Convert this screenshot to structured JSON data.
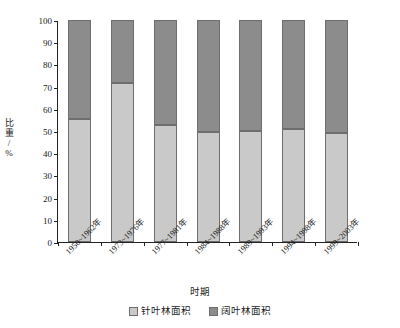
{
  "chart_data": {
    "type": "bar",
    "subtype": "stacked-100-percent",
    "title": "",
    "xlabel": "时期",
    "ylabel": "比重/%",
    "ylim": [
      0,
      100
    ],
    "yticks": [
      0,
      10,
      20,
      30,
      40,
      50,
      60,
      70,
      80,
      90,
      100
    ],
    "ytick_labels": [
      "0",
      "10",
      "20",
      "30",
      "40",
      "50",
      "60",
      "70",
      "80",
      "90",
      "100"
    ],
    "grid": false,
    "legend_position": "bottom-center",
    "categories": [
      "1950~1962年",
      "1973~1976年",
      "1977~1981年",
      "1984~1988年",
      "1989~1993年",
      "1994~1998年",
      "1999~2003年"
    ],
    "series": [
      {
        "name": "针叶林面积",
        "color": "#c9c9c9",
        "values": [
          55.5,
          71.5,
          52.5,
          49.5,
          50.0,
          51.0,
          49.0
        ]
      },
      {
        "name": "阔叶林面积",
        "color": "#8c8c8c",
        "values": [
          44.5,
          28.5,
          47.5,
          50.5,
          50.0,
          49.0,
          51.0
        ]
      }
    ]
  },
  "axis": {
    "y_title": "比重/%",
    "x_title": "时期"
  },
  "legend": {
    "items": [
      {
        "label": "针叶林面积",
        "color": "#c9c9c9"
      },
      {
        "label": "阔叶林面积",
        "color": "#8c8c8c"
      }
    ]
  },
  "colors": {
    "series_light": "#c9c9c9",
    "series_dark": "#8c8c8c",
    "axis": "#222222",
    "bar_outline": "#6e6e6e",
    "background": "#ffffff"
  }
}
